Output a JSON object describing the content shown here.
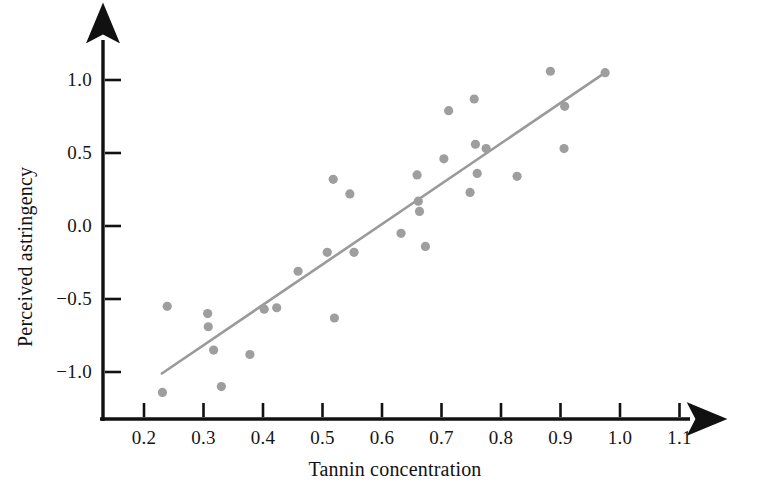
{
  "chart_data": {
    "type": "scatter",
    "title": "",
    "xlabel": "Tannin concentration",
    "ylabel": "Perceived astringency",
    "xlim": [
      0.13,
      1.18
    ],
    "ylim": [
      -1.27,
      1.17
    ],
    "xticks": [
      "0.2",
      "0.3",
      "0.4",
      "0.5",
      "0.6",
      "0.7",
      "0.8",
      "0.9",
      "1.0",
      "1.1"
    ],
    "xtick_values": [
      0.2,
      0.3,
      0.4,
      0.5,
      0.6,
      0.7,
      0.8,
      0.9,
      1.0,
      1.1
    ],
    "yticks": [
      "1.0",
      "0.5",
      "0.0",
      "−0.5",
      "−1.0"
    ],
    "ytick_values": [
      1.0,
      0.5,
      0.0,
      -0.5,
      -1.0
    ],
    "grid": false,
    "legend": "none",
    "marker_color": "#9e9e9e",
    "line_color": "#9a9a9a",
    "axis_color": "#111111",
    "points": [
      {
        "x": 0.231,
        "y": -1.14
      },
      {
        "x": 0.239,
        "y": -0.55
      },
      {
        "x": 0.307,
        "y": -0.6
      },
      {
        "x": 0.308,
        "y": -0.69
      },
      {
        "x": 0.317,
        "y": -0.85
      },
      {
        "x": 0.33,
        "y": -1.1
      },
      {
        "x": 0.378,
        "y": -0.88
      },
      {
        "x": 0.402,
        "y": -0.57
      },
      {
        "x": 0.423,
        "y": -0.56
      },
      {
        "x": 0.459,
        "y": -0.31
      },
      {
        "x": 0.508,
        "y": -0.18
      },
      {
        "x": 0.518,
        "y": 0.32
      },
      {
        "x": 0.52,
        "y": -0.63
      },
      {
        "x": 0.546,
        "y": 0.22
      },
      {
        "x": 0.553,
        "y": -0.18
      },
      {
        "x": 0.632,
        "y": -0.05
      },
      {
        "x": 0.659,
        "y": 0.35
      },
      {
        "x": 0.661,
        "y": 0.17
      },
      {
        "x": 0.663,
        "y": 0.1
      },
      {
        "x": 0.673,
        "y": -0.14
      },
      {
        "x": 0.704,
        "y": 0.46
      },
      {
        "x": 0.712,
        "y": 0.79
      },
      {
        "x": 0.748,
        "y": 0.23
      },
      {
        "x": 0.755,
        "y": 0.87
      },
      {
        "x": 0.757,
        "y": 0.56
      },
      {
        "x": 0.76,
        "y": 0.36
      },
      {
        "x": 0.775,
        "y": 0.53
      },
      {
        "x": 0.827,
        "y": 0.34
      },
      {
        "x": 0.883,
        "y": 1.06
      },
      {
        "x": 0.906,
        "y": 0.53
      },
      {
        "x": 0.907,
        "y": 0.82
      },
      {
        "x": 0.975,
        "y": 1.05
      }
    ],
    "fit_line": {
      "x_start": 0.23,
      "y_start": -1.01,
      "x_end": 0.975,
      "y_end": 1.05
    }
  }
}
